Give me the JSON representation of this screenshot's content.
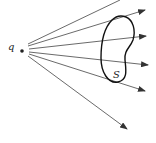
{
  "diagram": {
    "point_label": "q",
    "surface_label": "S",
    "colors": {
      "line": "#333333",
      "background": "#ffffff"
    },
    "rays": 6
  }
}
